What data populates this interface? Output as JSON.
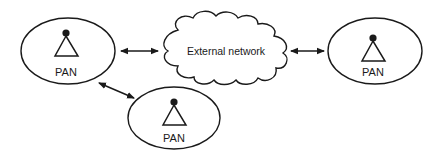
{
  "diagram": {
    "nodes": [
      {
        "id": "pan-left",
        "label": "PAN",
        "icon": "antenna-icon"
      },
      {
        "id": "external-network",
        "label": "External network",
        "shape": "cloud"
      },
      {
        "id": "pan-right",
        "label": "PAN",
        "icon": "antenna-icon"
      },
      {
        "id": "pan-bottom",
        "label": "PAN",
        "icon": "antenna-icon"
      }
    ],
    "edges": [
      {
        "from": "pan-left",
        "to": "external-network",
        "type": "bidirectional"
      },
      {
        "from": "external-network",
        "to": "pan-right",
        "type": "bidirectional"
      },
      {
        "from": "pan-left",
        "to": "pan-bottom",
        "type": "bidirectional"
      }
    ],
    "colors": {
      "stroke": "#1a1a1a",
      "background": "#ffffff"
    }
  }
}
